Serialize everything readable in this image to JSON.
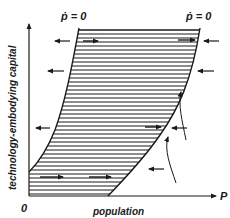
{
  "figure": {
    "type": "phase-diagram",
    "labels": {
      "left_isocline": "ṗ = 0",
      "right_isocline": "ṗ = 0",
      "y_axis": "technology-embodying capital",
      "x_axis": "population",
      "x_axis_symbol": "P",
      "origin": "0"
    },
    "colors": {
      "ink": "#1a1a1a",
      "background": "#ffffff"
    },
    "regions": {
      "hatched": "region between the two ṗ = 0 curves (population grows)"
    },
    "arrows": {
      "outside_left_pointing_left": 3,
      "outside_right_pointing_left": 4,
      "inside_pointing_right": 5
    }
  }
}
